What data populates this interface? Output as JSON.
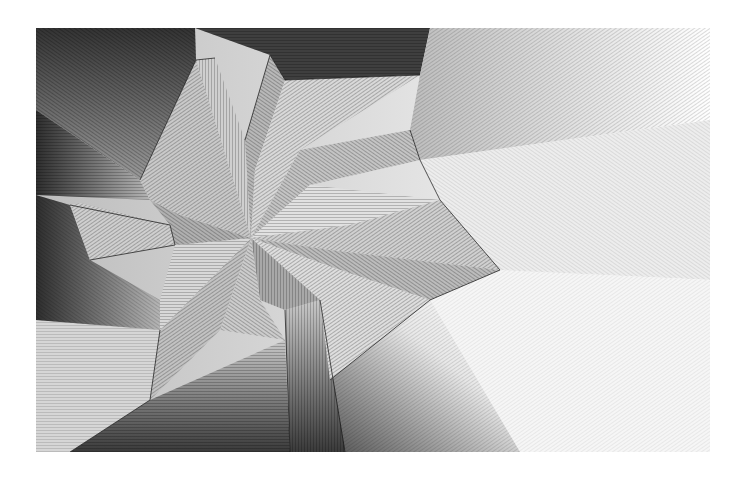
{
  "artwork": {
    "description": "Black and white line-hatched abstract geometric drawing of faceted planes radiating from a central vanishing point",
    "center": [
      251,
      238
    ],
    "bounds": {
      "x": 36,
      "y": 28,
      "width": 674,
      "height": 424
    },
    "colors": {
      "background": "#ffffff",
      "dark": "#1a1a1a",
      "mid": "#8a8a8a",
      "light": "#f2f2f2"
    }
  }
}
